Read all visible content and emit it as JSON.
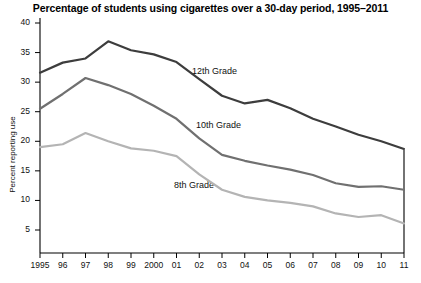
{
  "chart_data": {
    "type": "line",
    "title": "Percentage of students using cigarettes over a 30-day period, 1995–2011",
    "xlabel": "",
    "ylabel": "Percent reporting use",
    "x": [
      1995,
      1996,
      1997,
      1998,
      1999,
      2000,
      2001,
      2002,
      2003,
      2004,
      2005,
      2006,
      2007,
      2008,
      2009,
      2010,
      2011
    ],
    "categories": [
      "1995",
      "96",
      "97",
      "98",
      "99",
      "2000",
      "01",
      "02",
      "03",
      "04",
      "05",
      "06",
      "07",
      "08",
      "09",
      "10",
      "11"
    ],
    "xlim": [
      1995,
      2011
    ],
    "ylim": [
      0,
      40
    ],
    "yticks": [
      5,
      10,
      15,
      20,
      25,
      30,
      35,
      40
    ],
    "xticks": [
      "1995",
      "96",
      "97",
      "98",
      "99",
      "2000",
      "01",
      "02",
      "03",
      "04",
      "05",
      "06",
      "07",
      "08",
      "09",
      "10",
      "11"
    ],
    "grid": false,
    "legend_position": "inline-annotations",
    "series": [
      {
        "name": "12th Grade",
        "color": "#3d3d3d",
        "values": [
          31.6,
          33.3,
          34.0,
          36.9,
          35.4,
          34.7,
          33.4,
          30.5,
          27.7,
          26.4,
          27.0,
          25.6,
          23.8,
          22.5,
          21.1,
          20.0,
          18.7
        ]
      },
      {
        "name": "10th Grade",
        "color": "#707070",
        "values": [
          25.5,
          28.0,
          30.7,
          29.5,
          28.0,
          26.0,
          23.8,
          20.5,
          17.7,
          16.7,
          15.9,
          15.2,
          14.3,
          12.9,
          12.3,
          12.4,
          11.8
        ]
      },
      {
        "name": "8th Grade",
        "color": "#b4b4b4",
        "values": [
          19.0,
          19.5,
          21.4,
          20.0,
          18.8,
          18.4,
          17.5,
          14.4,
          11.8,
          10.6,
          10.0,
          9.6,
          9.0,
          7.8,
          7.2,
          7.5,
          6.1
        ]
      }
    ],
    "annotations": [
      {
        "text": "12th Grade",
        "x_px": 192,
        "y_px": 66
      },
      {
        "text": "10th Grade",
        "x_px": 196,
        "y_px": 120
      },
      {
        "text": "8th Grade",
        "x_px": 174,
        "y_px": 180
      }
    ]
  },
  "axes": {
    "y_tick_labels": [
      "40",
      "35",
      "30",
      "25",
      "20",
      "15",
      "10",
      "5"
    ],
    "x_tick_labels": [
      "1995",
      "96",
      "97",
      "98",
      "99",
      "2000",
      "01",
      "02",
      "03",
      "04",
      "05",
      "06",
      "07",
      "08",
      "09",
      "10",
      "11"
    ]
  }
}
